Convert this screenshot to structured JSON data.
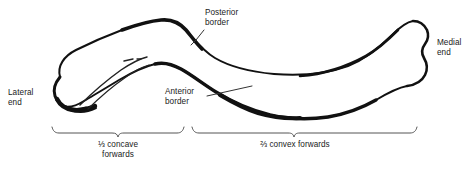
{
  "figure": {
    "background_color": "#ffffff",
    "outline_color": "#111111",
    "text_color": "#1a1a1a"
  },
  "labels": {
    "posterior_border": "Posterior\nborder",
    "anterior_border": "Anterior\nborder",
    "lateral_end": "Lateral\nend",
    "medial_end": "Medial\nend"
  },
  "brackets": {
    "left": {
      "label": "⅓ concave\nforwards",
      "fraction": "⅓",
      "description": "concave forwards"
    },
    "right": {
      "label": "⅔ convex forwards",
      "fraction": "⅔",
      "description": "convex forwards"
    }
  }
}
